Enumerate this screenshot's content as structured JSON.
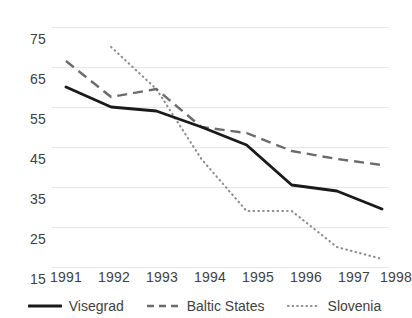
{
  "chart_data": {
    "type": "line",
    "title": "",
    "xlabel": "",
    "ylabel": "",
    "categories": [
      "1991",
      "1992",
      "1993",
      "1994",
      "1995",
      "1996",
      "1997",
      "1998"
    ],
    "x": [
      1991,
      1992,
      1993,
      1994,
      1995,
      1996,
      1997,
      1998
    ],
    "ylim": [
      15,
      75
    ],
    "yticks": [
      75,
      65,
      55,
      45,
      35,
      25,
      15
    ],
    "grid": true,
    "legend_position": "bottom",
    "series": [
      {
        "name": "Visegrad",
        "style": "solid",
        "color": "#1a1a1a",
        "values": [
          60.0,
          55.0,
          54.0,
          50.0,
          45.5,
          35.5,
          34.0,
          29.5
        ]
      },
      {
        "name": "Baltic States",
        "style": "dashed",
        "color": "#6b6b6b",
        "values": [
          66.5,
          57.5,
          59.5,
          50.0,
          48.5,
          44.0,
          42.0,
          40.5
        ]
      },
      {
        "name": "Slovenia",
        "style": "dotted",
        "color": "#8c8c8c",
        "values": [
          null,
          70.0,
          59.5,
          42.0,
          29.0,
          29.0,
          20.0,
          17.0
        ]
      }
    ]
  },
  "axis": {
    "y_labels": [
      "75",
      "65",
      "55",
      "45",
      "35",
      "25",
      "15"
    ],
    "x_labels": [
      "1991",
      "1992",
      "1993",
      "1994",
      "1995",
      "1996",
      "1997",
      "1998"
    ]
  },
  "legend": {
    "items": [
      {
        "label": "Visegrad"
      },
      {
        "label": "Baltic States"
      },
      {
        "label": "Slovenia"
      }
    ]
  }
}
